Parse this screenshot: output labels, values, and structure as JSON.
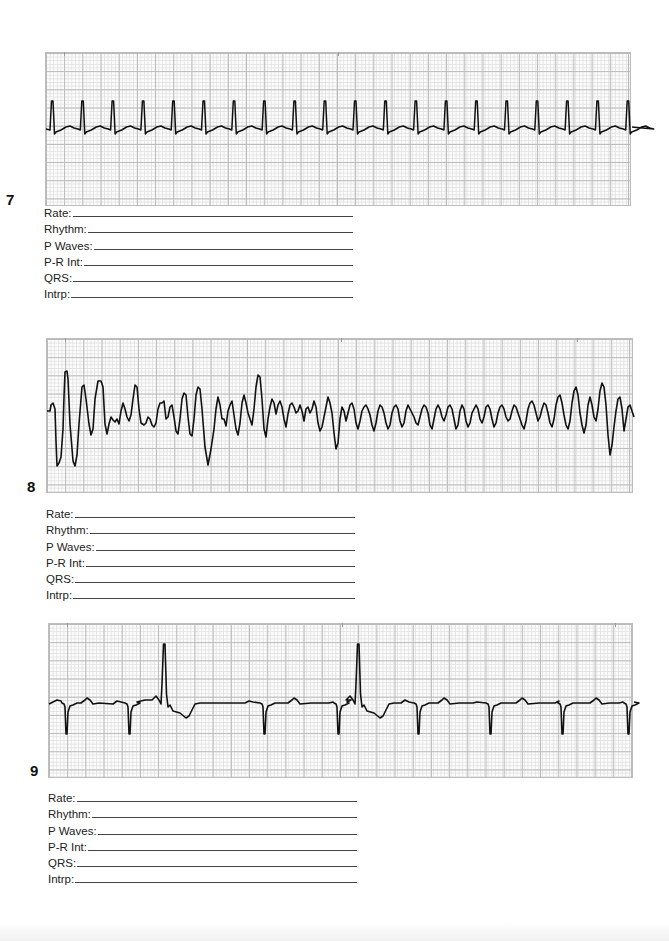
{
  "page": {
    "background": "#ffffff",
    "grid_minor_color": "#e3e3e3",
    "grid_major_color": "#b9b9b9",
    "trace_color": "#111111"
  },
  "field_labels": [
    "Rate:",
    "Rhythm:",
    "P Waves:",
    "P-R Int:",
    "QRS:",
    "Intrp:"
  ],
  "strips": [
    {
      "number": "7",
      "description": "regular narrow-complex tachycardia",
      "fields": [
        {
          "label": "Rate:",
          "value": ""
        },
        {
          "label": "Rhythm:",
          "value": ""
        },
        {
          "label": "P Waves:",
          "value": ""
        },
        {
          "label": "P-R Int:",
          "value": ""
        },
        {
          "label": "QRS:",
          "value": ""
        },
        {
          "label": "Intrp:",
          "value": ""
        }
      ]
    },
    {
      "number": "8",
      "description": "chaotic irregular waveform",
      "fields": [
        {
          "label": "Rate:",
          "value": ""
        },
        {
          "label": "Rhythm:",
          "value": ""
        },
        {
          "label": "P Waves:",
          "value": ""
        },
        {
          "label": "P-R Int:",
          "value": ""
        },
        {
          "label": "QRS:",
          "value": ""
        },
        {
          "label": "Intrp:",
          "value": ""
        }
      ]
    },
    {
      "number": "9",
      "description": "rhythm with negative QRS complexes and two tall premature upright complexes",
      "fields": [
        {
          "label": "Rate:",
          "value": ""
        },
        {
          "label": "Rhythm:",
          "value": ""
        },
        {
          "label": "P Waves:",
          "value": ""
        },
        {
          "label": "P-R Int:",
          "value": ""
        },
        {
          "label": "QRS:",
          "value": ""
        },
        {
          "label": "Intrp:",
          "value": ""
        }
      ]
    }
  ]
}
